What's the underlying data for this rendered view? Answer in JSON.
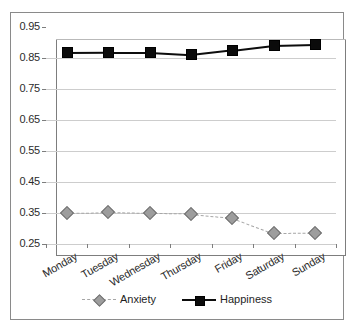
{
  "chart_data": {
    "type": "line",
    "title": "",
    "xlabel": "",
    "ylabel": "",
    "ylim": [
      0.25,
      0.95
    ],
    "yticks": [
      "0.95",
      "0.85",
      "0.75",
      "0.65",
      "0.55",
      "0.45",
      "0.35",
      "0.25"
    ],
    "ytick_values": [
      0.95,
      0.85,
      0.75,
      0.65,
      0.55,
      0.45,
      0.35,
      0.25
    ],
    "grid": true,
    "legend_position": "bottom",
    "categories": [
      "Monday",
      "Tuesday",
      "Wednesday",
      "Thursday",
      "Friday",
      "Saturday",
      "Sunday"
    ],
    "series": [
      {
        "name": "Anxiety",
        "values": [
          0.35,
          0.352,
          0.349,
          0.348,
          0.335,
          0.285,
          0.286
        ],
        "color": "#9d9d9d",
        "marker": "diamond",
        "linestyle": "dashed"
      },
      {
        "name": "Happiness",
        "values": [
          0.868,
          0.869,
          0.869,
          0.862,
          0.877,
          0.893,
          0.896
        ],
        "color": "#0d0d0d",
        "marker": "square",
        "linestyle": "solid"
      }
    ]
  },
  "legend": {
    "items": [
      {
        "label": "Anxiety"
      },
      {
        "label": "Happiness"
      }
    ]
  }
}
